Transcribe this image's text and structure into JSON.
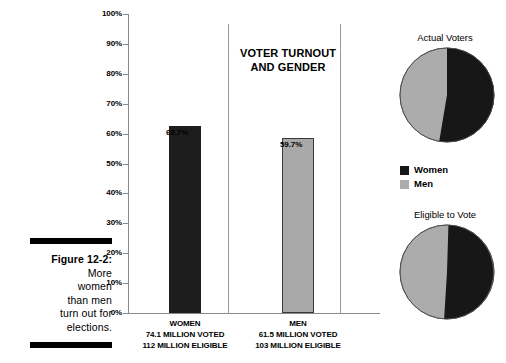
{
  "figure": {
    "label": "Figure 12-2:",
    "caption_lines": [
      "More",
      "women",
      "than men",
      "turn out for",
      "elections."
    ]
  },
  "chart_data": {
    "type": "bar",
    "title": "VOTER TURNOUT AND GENDER",
    "categories": [
      "WOMEN",
      "MEN"
    ],
    "values": [
      63.7,
      59.7
    ],
    "value_labels": [
      "63.7%",
      "59.7%"
    ],
    "xlabel": "",
    "ylabel": "",
    "ylim": [
      0,
      100
    ],
    "ytick_labels": [
      "100%",
      "90%",
      "80%",
      "70%",
      "60%",
      "50%",
      "40%",
      "30%",
      "20%",
      "10%",
      "0%"
    ],
    "ytick_values": [
      100,
      90,
      80,
      70,
      60,
      50,
      40,
      30,
      20,
      10,
      0
    ],
    "grid": false,
    "legend_position": "right",
    "series": [
      {
        "name": "WOMEN",
        "value": 63.7,
        "value_label": "63.7%",
        "color": "#1d1d1d",
        "stat_voted": "74.1 MILLION VOTED",
        "stat_eligible": "112 MILLION ELIGIBLE"
      },
      {
        "name": "MEN",
        "value": 59.7,
        "value_label": "59.7%",
        "color": "#a9a9a9",
        "stat_voted": "61.5 MILLION VOTED",
        "stat_eligible": "103 MILLION ELIGIBLE"
      }
    ]
  },
  "pies": [
    {
      "title": "Actual Voters",
      "type": "pie",
      "slices": [
        {
          "name": "Women",
          "value": 54.6,
          "color": "#171717"
        },
        {
          "name": "Men",
          "value": 45.4,
          "color": "#acacac"
        }
      ]
    },
    {
      "title": "Eligible to Vote",
      "type": "pie",
      "slices": [
        {
          "name": "Women",
          "value": 52.1,
          "color": "#171717"
        },
        {
          "name": "Men",
          "value": 47.9,
          "color": "#acacac"
        }
      ]
    }
  ],
  "legend": {
    "items": [
      {
        "label": "Women",
        "color": "#171717"
      },
      {
        "label": "Men",
        "color": "#acacac"
      }
    ]
  }
}
